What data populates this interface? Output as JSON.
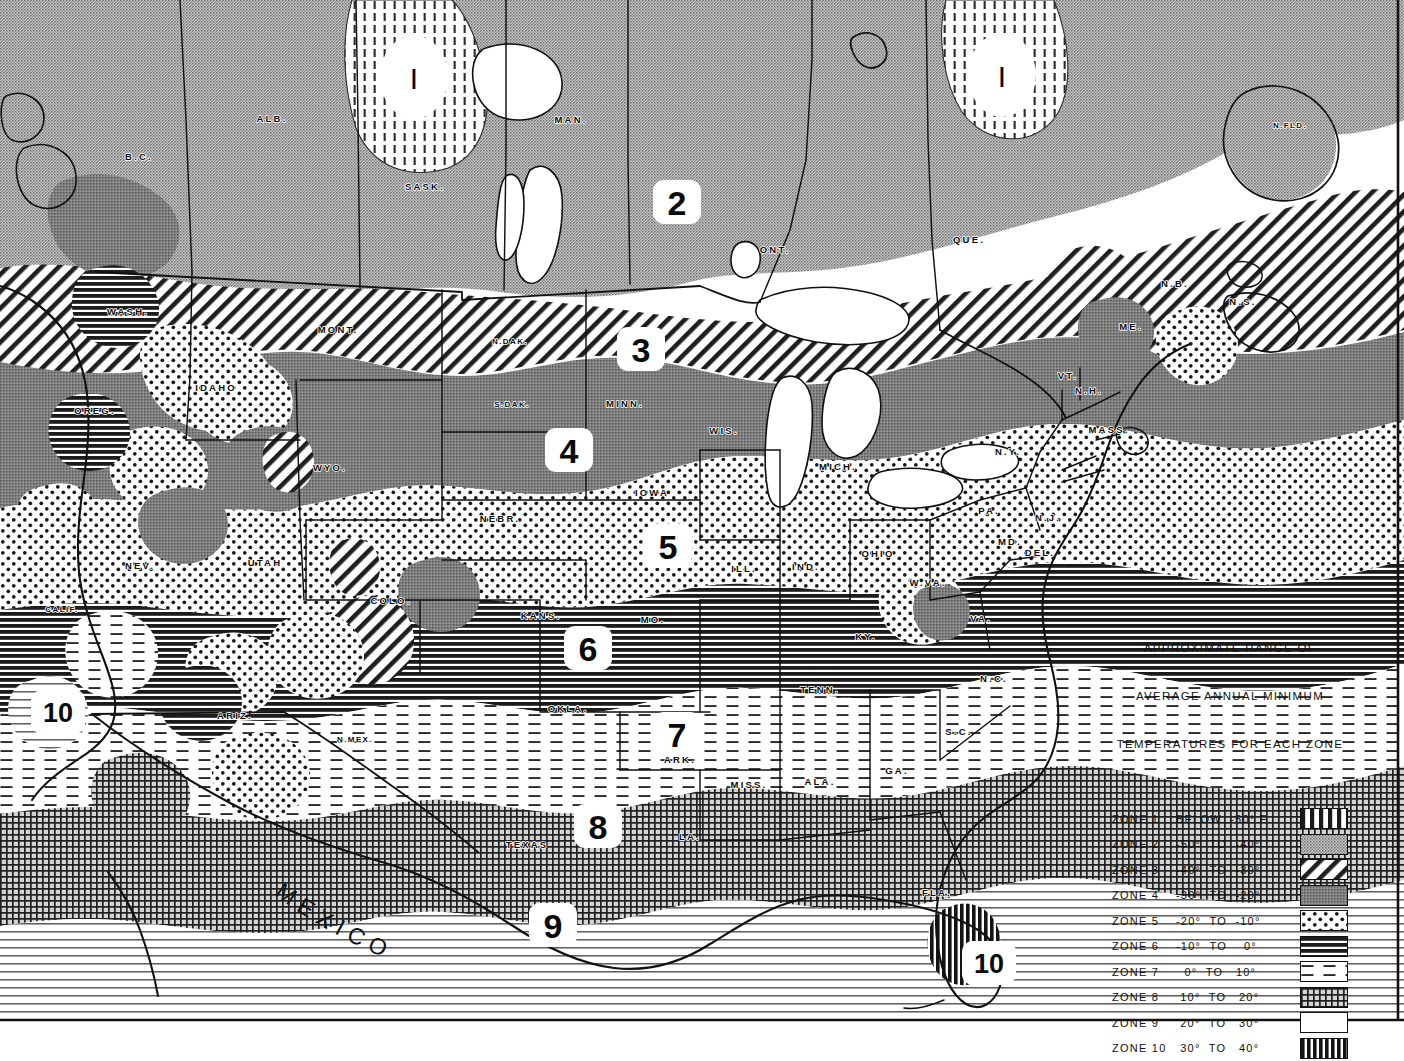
{
  "map": {
    "title": "Plant Hardiness Zone Map",
    "country_labels": [
      {
        "name": "MEXICO",
        "text": "MEXICO"
      }
    ],
    "region_labels": [
      {
        "id": "alb",
        "text": "ALB.",
        "x": 272,
        "y": 122
      },
      {
        "id": "sask",
        "text": "SASK.",
        "x": 425,
        "y": 190
      },
      {
        "id": "man",
        "text": "MAN.",
        "x": 571,
        "y": 123
      },
      {
        "id": "ont",
        "text": "ONT.",
        "x": 775,
        "y": 253
      },
      {
        "id": "que",
        "text": "QUE.",
        "x": 969,
        "y": 243
      },
      {
        "id": "nb",
        "text": "N.B.",
        "x": 1175,
        "y": 287
      },
      {
        "id": "ns",
        "text": "N.S.",
        "x": 1243,
        "y": 305
      },
      {
        "id": "nfld",
        "text": "N.FLD.",
        "x": 1290,
        "y": 128
      },
      {
        "id": "bc",
        "text": "B.C.",
        "x": 139,
        "y": 160
      },
      {
        "id": "wash",
        "text": "WASH.",
        "x": 128,
        "y": 315
      },
      {
        "id": "mont",
        "text": "MONT.",
        "x": 338,
        "y": 333
      },
      {
        "id": "idaho",
        "text": "IDAHO",
        "x": 216,
        "y": 391
      },
      {
        "id": "oreg",
        "text": "OREG.",
        "x": 95,
        "y": 414
      },
      {
        "id": "ndak",
        "text": "N.DAK.",
        "x": 510,
        "y": 344
      },
      {
        "id": "sdak",
        "text": "S.DAK.",
        "x": 512,
        "y": 407
      },
      {
        "id": "minn",
        "text": "MINN.",
        "x": 625,
        "y": 407
      },
      {
        "id": "wis",
        "text": "WIS.",
        "x": 724,
        "y": 434
      },
      {
        "id": "mich",
        "text": "MICH.",
        "x": 838,
        "y": 470
      },
      {
        "id": "iowa",
        "text": "IOWA",
        "x": 652,
        "y": 496
      },
      {
        "id": "nebr",
        "text": "NEBR.",
        "x": 500,
        "y": 522
      },
      {
        "id": "wyo",
        "text": "WYO.",
        "x": 330,
        "y": 471
      },
      {
        "id": "nev",
        "text": "NEV.",
        "x": 140,
        "y": 569
      },
      {
        "id": "utah",
        "text": "UTAH",
        "x": 265,
        "y": 566
      },
      {
        "id": "colo",
        "text": "COLO.",
        "x": 391,
        "y": 604
      },
      {
        "id": "kans",
        "text": "KANS.",
        "x": 541,
        "y": 619
      },
      {
        "id": "mo",
        "text": "MO.",
        "x": 653,
        "y": 623
      },
      {
        "id": "ill",
        "text": "ILL.",
        "x": 744,
        "y": 572
      },
      {
        "id": "ind",
        "text": "IND.",
        "x": 806,
        "y": 570
      },
      {
        "id": "ohio",
        "text": "OHIO",
        "x": 878,
        "y": 557
      },
      {
        "id": "pa",
        "text": "PA.",
        "x": 989,
        "y": 514
      },
      {
        "id": "ny",
        "text": "N.Y.",
        "x": 1008,
        "y": 455
      },
      {
        "id": "vt",
        "text": "VT.",
        "x": 1068,
        "y": 379
      },
      {
        "id": "nh",
        "text": "N.H.",
        "x": 1089,
        "y": 394
      },
      {
        "id": "me",
        "text": "ME.",
        "x": 1131,
        "y": 330
      },
      {
        "id": "mass",
        "text": "MASS.",
        "x": 1109,
        "y": 433
      },
      {
        "id": "md",
        "text": "MD.",
        "x": 1010,
        "y": 545
      },
      {
        "id": "del",
        "text": "DEL.",
        "x": 1040,
        "y": 556
      },
      {
        "id": "nj",
        "text": "N.J.",
        "x": 1048,
        "y": 521
      },
      {
        "id": "wva",
        "text": "W.VA.",
        "x": 928,
        "y": 586
      },
      {
        "id": "va",
        "text": "VA.",
        "x": 981,
        "y": 622
      },
      {
        "id": "ky",
        "text": "KY.",
        "x": 866,
        "y": 640
      },
      {
        "id": "tenn",
        "text": "TENN.",
        "x": 820,
        "y": 693
      },
      {
        "id": "nc",
        "text": "N.C.",
        "x": 994,
        "y": 682
      },
      {
        "id": "sc",
        "text": "S.C.",
        "x": 959,
        "y": 735
      },
      {
        "id": "ga",
        "text": "GA.",
        "x": 897,
        "y": 774
      },
      {
        "id": "ala",
        "text": "ALA.",
        "x": 820,
        "y": 785
      },
      {
        "id": "miss",
        "text": "MISS.",
        "x": 749,
        "y": 788
      },
      {
        "id": "ark",
        "text": "ARK.",
        "x": 680,
        "y": 763
      },
      {
        "id": "la",
        "text": "LA.",
        "x": 690,
        "y": 840
      },
      {
        "id": "okla",
        "text": "OKLA.",
        "x": 568,
        "y": 712
      },
      {
        "id": "texas",
        "text": "TEXAS",
        "x": 527,
        "y": 848
      },
      {
        "id": "nmex",
        "text": "N.MEX.",
        "x": 355,
        "y": 742
      },
      {
        "id": "ariz",
        "text": "ARIZ.",
        "x": 235,
        "y": 719
      },
      {
        "id": "calif",
        "text": "CALIF.",
        "x": 62,
        "y": 612
      },
      {
        "id": "fla",
        "text": "FLA.",
        "x": 937,
        "y": 896
      }
    ],
    "zone_markers": [
      {
        "zone": "1",
        "label": "I",
        "x": 414,
        "y": 77,
        "style": "roman"
      },
      {
        "zone": "1b",
        "label": "I",
        "x": 1002,
        "y": 75,
        "style": "roman"
      },
      {
        "zone": "2",
        "label": "2",
        "x": 677,
        "y": 202,
        "style": "normal"
      },
      {
        "zone": "3",
        "label": "3",
        "x": 641,
        "y": 349,
        "style": "normal"
      },
      {
        "zone": "4",
        "label": "4",
        "x": 569,
        "y": 450,
        "style": "normal"
      },
      {
        "zone": "5",
        "label": "5",
        "x": 668,
        "y": 546,
        "style": "normal"
      },
      {
        "zone": "6",
        "label": "6",
        "x": 588,
        "y": 648,
        "style": "normal"
      },
      {
        "zone": "7",
        "label": "7",
        "x": 677,
        "y": 734,
        "style": "normal"
      },
      {
        "zone": "8",
        "label": "8",
        "x": 598,
        "y": 826,
        "style": "normal"
      },
      {
        "zone": "9",
        "label": "9",
        "x": 553,
        "y": 925,
        "style": "normal"
      },
      {
        "zone": "10",
        "label": "10",
        "x": 989,
        "y": 963,
        "style": "small"
      },
      {
        "zone": "10w",
        "label": "10",
        "x": 58,
        "y": 712,
        "style": "small"
      }
    ]
  },
  "legend": {
    "title_line1": "APPROXIMATE RANGE OF",
    "title_line2": "AVERAGE ANNUAL MINIMUM",
    "title_line3": "TEMPERATURES FOR EACH ZONE",
    "rows": [
      {
        "zone_label": "ZONE 1",
        "range": "BELOW  -50° F",
        "pattern": "zone1"
      },
      {
        "zone_label": "ZONE 2",
        "range": "-50°  TO  -40°",
        "pattern": "zone2"
      },
      {
        "zone_label": "ZONE 3",
        "range": "-40°  TO  -30°",
        "pattern": "zone3"
      },
      {
        "zone_label": "ZONE 4",
        "range": "-30°  TO  -20°",
        "pattern": "zone4"
      },
      {
        "zone_label": "ZONE 5",
        "range": "-20°  TO  -10°",
        "pattern": "zone5"
      },
      {
        "zone_label": "ZONE 6",
        "range": "-10°  TO    0°",
        "pattern": "zone6"
      },
      {
        "zone_label": "ZONE 7",
        "range": "  0°  TO   10°",
        "pattern": "zone7"
      },
      {
        "zone_label": "ZONE 8",
        "range": " 10°  TO   20°",
        "pattern": "zone8"
      },
      {
        "zone_label": "ZONE 9",
        "range": " 20°  TO   30°",
        "pattern": "zone9"
      },
      {
        "zone_label": "ZONE 10",
        "range": " 30°  TO   40°",
        "pattern": "zone10"
      }
    ]
  },
  "colors": {
    "ink": "#111111",
    "paper": "#ffffff",
    "zone2_fill": "#b4b4b4",
    "zone4_fill": "#8a8a8a",
    "zone8_fill": "#9a9a9a"
  }
}
